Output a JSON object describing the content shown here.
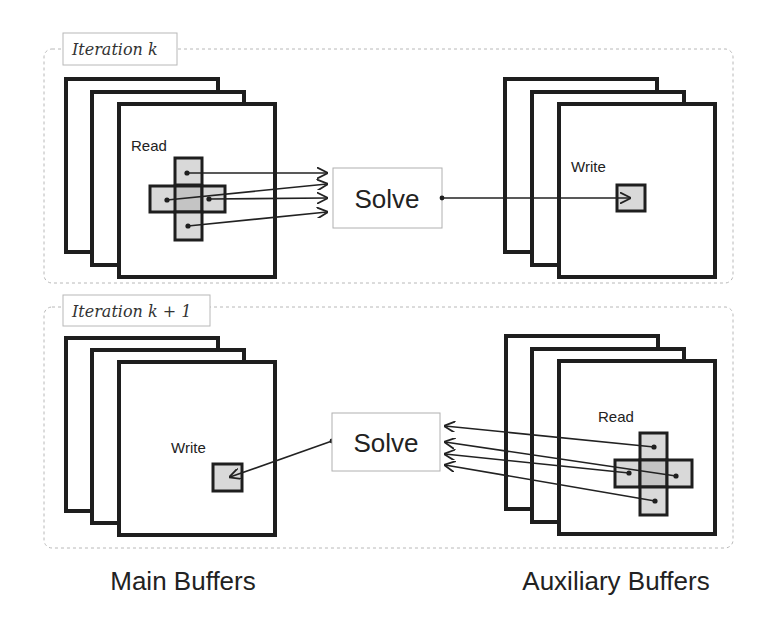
{
  "diagram": {
    "type": "buffer-iteration-flow",
    "iterations": [
      {
        "label": "Iteration k",
        "solve_label": "Solve",
        "left_stack": {
          "action_label": "Read",
          "pattern": "cross-stencil"
        },
        "right_stack": {
          "action_label": "Write",
          "pattern": "single-cell"
        },
        "flow": "left-to-right"
      },
      {
        "label": "Iteration k + 1",
        "solve_label": "Solve",
        "left_stack": {
          "action_label": "Write",
          "pattern": "single-cell"
        },
        "right_stack": {
          "action_label": "Read",
          "pattern": "cross-stencil"
        },
        "flow": "right-to-left"
      }
    ],
    "captions": {
      "left": "Main Buffers",
      "right": "Auxiliary Buffers"
    },
    "colors": {
      "panel_border": "#1e1e1e",
      "cell_fill": "#d9d9d9",
      "dashed_border": "#b8b8b8"
    }
  }
}
